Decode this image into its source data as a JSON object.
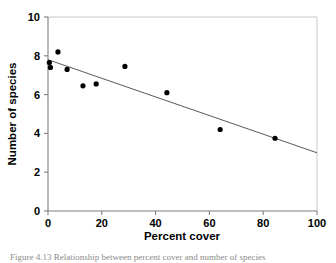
{
  "figure": {
    "caption": "Figure 4.13  Relationship between percent cover and number of species"
  },
  "chart_data": {
    "type": "scatter",
    "title": "",
    "xlabel": "Percent cover",
    "ylabel": "Number of species",
    "xlim": [
      0,
      100
    ],
    "ylim": [
      0,
      10
    ],
    "xticks": [
      0,
      20,
      40,
      60,
      80,
      100
    ],
    "yticks": [
      0,
      2,
      4,
      6,
      8,
      10
    ],
    "xtick_labels": [
      "0",
      "20",
      "40",
      "60",
      "80",
      "100"
    ],
    "ytick_labels": [
      "0",
      "2",
      "4",
      "6",
      "8",
      "10"
    ],
    "grid": false,
    "legend": null,
    "marker": {
      "shape": "circle",
      "color": "#000000",
      "size_px": 5.2
    },
    "points": [
      {
        "x": 0.5,
        "y": 7.65
      },
      {
        "x": 0.9,
        "y": 7.4
      },
      {
        "x": 3.7,
        "y": 8.2
      },
      {
        "x": 7.1,
        "y": 7.3
      },
      {
        "x": 13.0,
        "y": 6.45
      },
      {
        "x": 17.9,
        "y": 6.55
      },
      {
        "x": 28.6,
        "y": 7.45
      },
      {
        "x": 44.2,
        "y": 6.1
      },
      {
        "x": 64.0,
        "y": 4.2
      },
      {
        "x": 84.4,
        "y": 3.75
      }
    ],
    "trendline": {
      "type": "linear",
      "color": "#444444",
      "width_px": 0.9,
      "x_start": 0,
      "y_start": 7.8,
      "x_end": 100,
      "y_end": 3.0
    },
    "axis_style": {
      "spine_color": "#7f7f7f",
      "plot_border_color": "#c8c8c8",
      "tick_length_px": 4
    }
  }
}
